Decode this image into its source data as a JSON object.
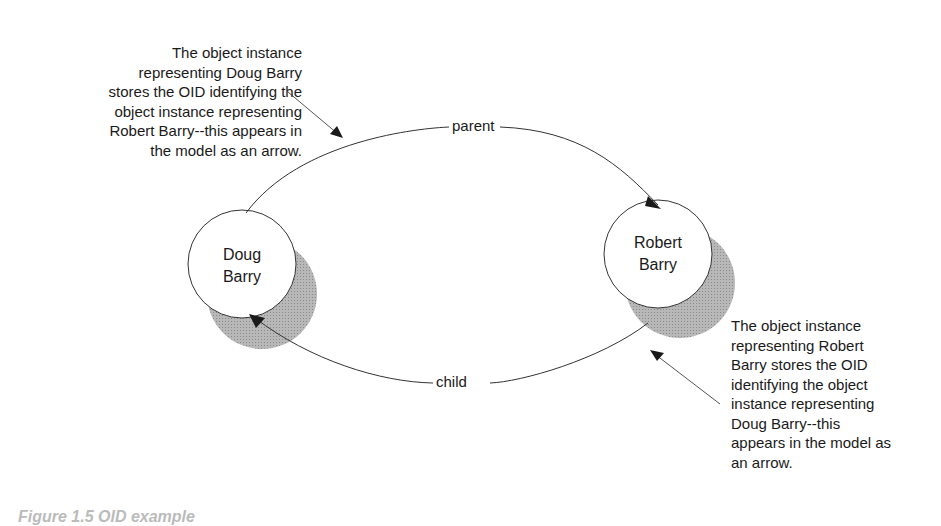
{
  "diagram": {
    "nodes": [
      {
        "id": "doug",
        "label_lines": [
          "Doug",
          "Barry"
        ]
      },
      {
        "id": "robert",
        "label_lines": [
          "Robert",
          "Barry"
        ]
      }
    ],
    "edges": [
      {
        "from": "doug",
        "to": "robert",
        "label": "parent"
      },
      {
        "from": "robert",
        "to": "doug",
        "label": "child"
      }
    ],
    "annotations": {
      "left": {
        "lines": [
          "The object instance",
          "representing Doug Barry",
          "stores the OID identifying the",
          "object instance representing",
          "Robert Barry--this appears in",
          "the model as an arrow."
        ]
      },
      "right": {
        "lines": [
          "The object instance",
          "representing Robert",
          "Barry stores the OID",
          "identifying the object",
          "instance representing",
          "Doug Barry--this",
          "appears in the model as",
          "an arrow."
        ]
      }
    },
    "caption": "Figure 1.5  OID example",
    "colors": {
      "line": "#333333",
      "shadow": "#a8a8a8",
      "node_fill": "#ffffff"
    }
  }
}
